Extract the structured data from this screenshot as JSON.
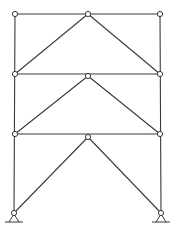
{
  "figure": {
    "type": "three-story braced frame with inverted-V (chevron) bracing",
    "stories": 3,
    "colors": {
      "line": "#3a3a3a",
      "background": "#ffffff",
      "hinge_fill": "#ffffff"
    },
    "nodes": [
      {
        "id": "roof-left",
        "x": 15,
        "y": 14,
        "hinge": true
      },
      {
        "id": "roof-center",
        "x": 88,
        "y": 14,
        "hinge": true
      },
      {
        "id": "roof-right",
        "x": 160,
        "y": 14,
        "hinge": true
      },
      {
        "id": "level2-left",
        "x": 15,
        "y": 74,
        "hinge": true
      },
      {
        "id": "level2-center",
        "x": 88,
        "y": 76,
        "hinge": true
      },
      {
        "id": "level2-right",
        "x": 160,
        "y": 74,
        "hinge": true
      },
      {
        "id": "level1-left",
        "x": 15,
        "y": 134,
        "hinge": true
      },
      {
        "id": "level1-center",
        "x": 88,
        "y": 137,
        "hinge": true
      },
      {
        "id": "level1-right",
        "x": 160,
        "y": 134,
        "hinge": true
      },
      {
        "id": "base-left",
        "x": 14,
        "y": 213,
        "hinge": true,
        "support": "pin"
      },
      {
        "id": "base-right",
        "x": 161,
        "y": 213,
        "hinge": true,
        "support": "pin"
      }
    ],
    "members": [
      {
        "type": "column",
        "from": "roof-left",
        "to": "base-left"
      },
      {
        "type": "column",
        "from": "roof-right",
        "to": "base-right"
      },
      {
        "type": "beam",
        "from": "roof-left",
        "to": "roof-right"
      },
      {
        "type": "beam",
        "from": "level2-left",
        "to": "level2-right"
      },
      {
        "type": "beam",
        "from": "level1-left",
        "to": "level1-right"
      },
      {
        "type": "brace",
        "from": "roof-center",
        "to": "level2-left"
      },
      {
        "type": "brace",
        "from": "roof-center",
        "to": "level2-right"
      },
      {
        "type": "brace",
        "from": "level2-center",
        "to": "level1-left"
      },
      {
        "type": "brace",
        "from": "level2-center",
        "to": "level1-right"
      },
      {
        "type": "brace",
        "from": "level1-center",
        "to": "base-left"
      },
      {
        "type": "brace",
        "from": "level1-center",
        "to": "base-right"
      }
    ],
    "supports": [
      {
        "node": "base-left",
        "type": "pinned"
      },
      {
        "node": "base-right",
        "type": "pinned"
      }
    ]
  }
}
